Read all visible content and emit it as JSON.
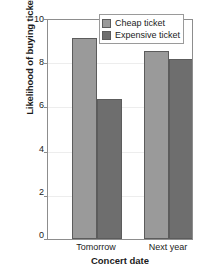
{
  "chart_data": {
    "type": "bar",
    "title": "",
    "subtitle": "",
    "xlabel": "Concert date",
    "ylabel": "Likelihood of buying ticket",
    "categories": [
      "Tomorrow",
      "Next year"
    ],
    "series": [
      {
        "name": "Cheap ticket",
        "values": [
          9.2,
          8.6
        ],
        "color": "#9a9a9a"
      },
      {
        "name": "Expensive ticket",
        "values": [
          6.4,
          8.2
        ],
        "color": "#6e6e6e"
      }
    ],
    "ylim": [
      0,
      10
    ],
    "yticks": [
      0,
      2,
      4,
      6,
      8,
      10
    ],
    "ytick_labels": [
      "0",
      "2",
      "4",
      "6",
      "8",
      "10"
    ],
    "grid": true,
    "grid_axis": "y",
    "legend_position": "top-right",
    "bar_edge_color": "#5c5c5c",
    "axis_color": "#8d8d8d",
    "gridline_color": "#ededed",
    "background": "#ffffff"
  },
  "legend": {
    "items": [
      {
        "label": "Cheap ticket",
        "color": "#9a9a9a"
      },
      {
        "label": "Expensive ticket",
        "color": "#6e6e6e"
      }
    ]
  },
  "axes": {
    "y_title": "Likelihood of buying ticket",
    "x_title": "Concert date",
    "y_tick_0": "0",
    "y_tick_1": "2",
    "y_tick_2": "4",
    "y_tick_3": "6",
    "y_tick_4": "8",
    "y_tick_5": "10",
    "x_tick_0": "Tomorrow",
    "x_tick_1": "Next year"
  }
}
